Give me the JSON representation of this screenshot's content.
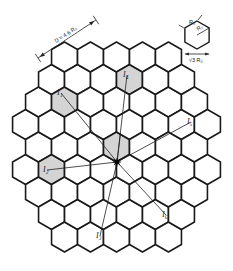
{
  "diagram": {
    "cell_radius_px": 15,
    "center_px": [
      116.5,
      147
    ],
    "hex_orientation": "pointy-top",
    "grid_radius": 4,
    "colors": {
      "line": "#1a1a1a",
      "shaded": "#d4d4d4",
      "background": "#ffffff"
    },
    "mobile": {
      "icon": "star-icon",
      "position_px": [
        117,
        162
      ]
    },
    "serving_cell": {
      "q": 0,
      "r": 0,
      "shaded": true
    },
    "interferers": [
      {
        "label": "I1",
        "display": "I₁",
        "center_px": [
          64,
          101
        ],
        "label_px": [
          57,
          95
        ]
      },
      {
        "label": "I2",
        "display": "I₂",
        "center_px": [
          51,
          170
        ],
        "label_px": [
          43,
          172
        ]
      },
      {
        "label": "I3",
        "display": "I₃",
        "center_px": [
          103,
          239
        ],
        "label_px": [
          96,
          238
        ]
      },
      {
        "label": "I4",
        "display": "I₄",
        "center_px": [
          129,
          78
        ],
        "label_px": [
          123,
          77
        ]
      },
      {
        "label": "I5",
        "display": "I₅",
        "center_px": [
          194,
          124
        ],
        "label_px": [
          187,
          124
        ]
      },
      {
        "label": "I6",
        "display": "I₆",
        "center_px": [
          168,
          216
        ],
        "label_px": [
          162,
          217
        ]
      }
    ],
    "distance_annotation": {
      "text": "D = 4.6 R₀",
      "from_px": [
        38,
        58
      ],
      "to_px": [
        96,
        20
      ],
      "text_px": [
        56,
        43
      ]
    },
    "legend_hex": {
      "center_px": [
        197,
        35
      ],
      "radius_px": 14,
      "top_label": "R₀",
      "inner_label": "R₀",
      "bottom_label": "√3 R₀"
    }
  }
}
